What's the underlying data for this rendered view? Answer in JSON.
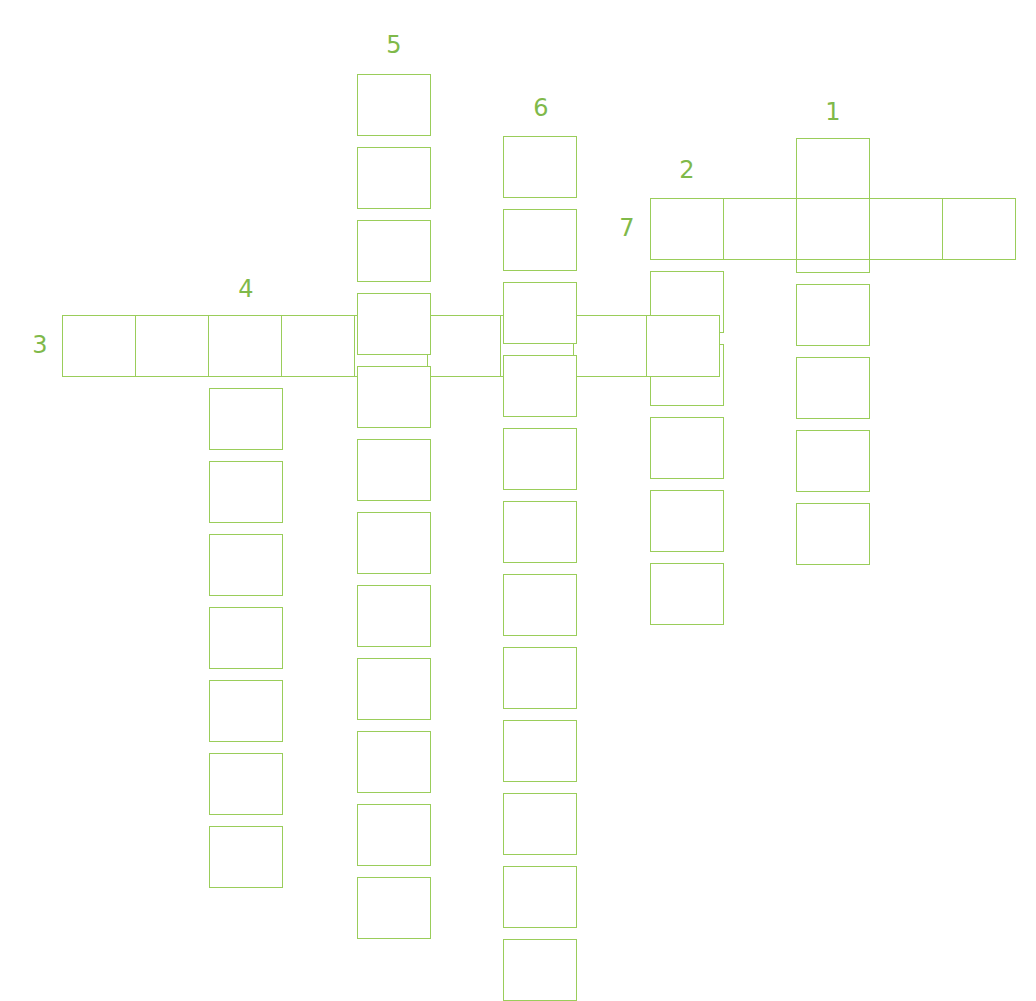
{
  "puzzle": {
    "type": "crossword",
    "line_color": "#9acd5a",
    "number_color": "#7fb94a",
    "cell_size": 73,
    "words": [
      {
        "number": "1",
        "direction": "down",
        "length": 6,
        "x": 796,
        "y": 138,
        "label_x": 833,
        "label_y": 100
      },
      {
        "number": "2",
        "direction": "down",
        "length": 6,
        "x": 650,
        "y": 198,
        "label_x": 687,
        "label_y": 158
      },
      {
        "number": "3",
        "direction": "across",
        "length": 9,
        "x": 62,
        "y": 315,
        "label_x": 40,
        "label_y": 333
      },
      {
        "number": "4",
        "direction": "down",
        "length": 8,
        "x": 209,
        "y": 315,
        "label_x": 246,
        "label_y": 277
      },
      {
        "number": "5",
        "direction": "down",
        "length": 12,
        "x": 357,
        "y": 74,
        "label_x": 394,
        "label_y": 33
      },
      {
        "number": "6",
        "direction": "down",
        "length": 12,
        "x": 503,
        "y": 136,
        "label_x": 541,
        "label_y": 96
      },
      {
        "number": "7",
        "direction": "across",
        "length": 5,
        "x": 650,
        "y": 198,
        "label_x": 627,
        "label_y": 216
      }
    ]
  }
}
